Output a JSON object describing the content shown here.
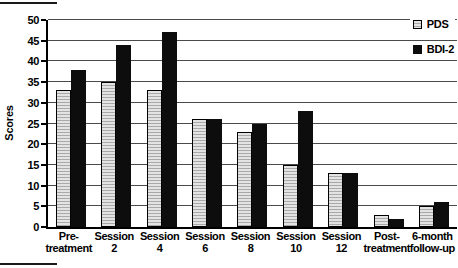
{
  "figure": {
    "ylabel": "Scores",
    "legend": [
      {
        "label": "PDS",
        "swatch_icon": "hatched-square-swatch"
      },
      {
        "label": "BDI-2",
        "swatch_icon": "black-square-swatch"
      }
    ]
  },
  "chart_data": {
    "type": "bar",
    "categories": [
      "Pre-treatment",
      "Session 2",
      "Session 4",
      "Session 6",
      "Session 8",
      "Session 10",
      "Session 12",
      "Post-treatment",
      "6-month follow-up"
    ],
    "category_labels": [
      "Pre-\ntreatment",
      "Session\n2",
      "Session\n4",
      "Session\n6",
      "Session\n8",
      "Session\n10",
      "Session\n12",
      "Post-\ntreatment",
      "6-month\nfollow-up"
    ],
    "series": [
      {
        "name": "PDS",
        "values": [
          33,
          35,
          33,
          26,
          23,
          15,
          13,
          3,
          5
        ],
        "style": "light-gray-horizontal-hatch",
        "color": "#e3e3e3"
      },
      {
        "name": "BDI-2",
        "values": [
          38,
          44,
          47,
          26,
          25,
          28,
          13,
          2,
          6
        ],
        "style": "solid",
        "color": "#0d0d0d"
      }
    ],
    "title": "",
    "xlabel": "",
    "ylabel": "Scores",
    "ylim": [
      0,
      50
    ],
    "ytick_step": 5,
    "grid": true,
    "legend_position": "top-right"
  }
}
